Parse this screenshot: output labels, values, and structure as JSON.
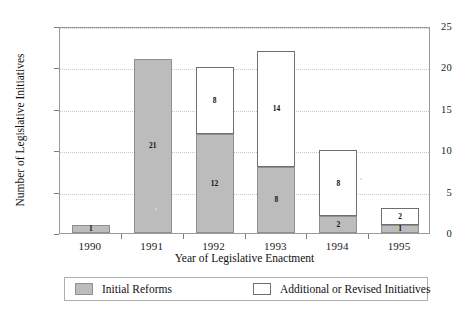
{
  "chart_data": {
    "type": "bar",
    "subtype": "stacked",
    "title": "",
    "xlabel": "Year of Legislative Enactment",
    "ylabel": "Number of Legislative Initiatives",
    "categories": [
      "1990",
      "1991",
      "1992",
      "1993",
      "1994",
      "1995"
    ],
    "ylim": [
      0,
      25
    ],
    "yticks": [
      0,
      5,
      10,
      15,
      20,
      25
    ],
    "ytick_labels": [
      "0",
      "5",
      "10",
      "15",
      "20",
      "25"
    ],
    "grid": true,
    "grid_axis": "y",
    "legend_position": "bottom",
    "series": [
      {
        "name": "Initial Reforms",
        "color": "#bcbcbc",
        "values": [
          1,
          21,
          12,
          8,
          2,
          1
        ]
      },
      {
        "name": "Additional or Revised Initiatives",
        "color": "#ffffff",
        "values": [
          0,
          0,
          8,
          14,
          8,
          2
        ]
      }
    ],
    "totals": [
      1,
      21,
      20,
      22,
      10,
      3
    ],
    "data_labels": {
      "1990": {
        "initial": "1",
        "additional": ""
      },
      "1991": {
        "initial": "21",
        "additional": ""
      },
      "1992": {
        "initial": "12",
        "additional": "8"
      },
      "1993": {
        "initial": "8",
        "additional": "14"
      },
      "1994": {
        "initial": "2",
        "additional": "8"
      },
      "1995": {
        "initial": "1",
        "additional": "2"
      }
    }
  },
  "axes": {
    "y_title": "Number of Legislative Initiatives",
    "x_title": "Year of Legislative Enactment",
    "y_ticks": [
      {
        "label": "25",
        "value": 25
      },
      {
        "label": "20",
        "value": 20
      },
      {
        "label": "15",
        "value": 15
      },
      {
        "label": "10",
        "value": 10
      },
      {
        "label": "5",
        "value": 5
      },
      {
        "label": "0",
        "value": 0
      }
    ],
    "x_ticks": [
      {
        "label": "1990"
      },
      {
        "label": "1991"
      },
      {
        "label": "1992"
      },
      {
        "label": "1993"
      },
      {
        "label": "1994"
      },
      {
        "label": "1995"
      }
    ]
  },
  "bars": [
    {
      "year": "1990",
      "initial_value": 1,
      "initial_label": "1",
      "additional_value": 0,
      "additional_label": ""
    },
    {
      "year": "1991",
      "initial_value": 21,
      "initial_label": "21",
      "additional_value": 0,
      "additional_label": ""
    },
    {
      "year": "1992",
      "initial_value": 12,
      "initial_label": "12",
      "additional_value": 8,
      "additional_label": "8"
    },
    {
      "year": "1993",
      "initial_value": 8,
      "initial_label": "8",
      "additional_value": 14,
      "additional_label": "14"
    },
    {
      "year": "1994",
      "initial_value": 2,
      "initial_label": "2",
      "additional_value": 8,
      "additional_label": "8"
    },
    {
      "year": "1995",
      "initial_value": 1,
      "initial_label": "1",
      "additional_value": 2,
      "additional_label": "2"
    }
  ],
  "legend": {
    "items": [
      {
        "label": "Initial Reforms",
        "color": "#bcbcbc",
        "swatch": "initial"
      },
      {
        "label": "Additional or Revised Initiatives",
        "color": "#ffffff",
        "swatch": "additional"
      }
    ]
  },
  "colors": {
    "initial_reforms_fill": "#bcbcbc",
    "additional_fill": "#ffffff",
    "bar_outline": "#8f8f8f",
    "grid": "#c9c9c9",
    "frame": "#9a9a9a",
    "text": "#1a1a1a"
  }
}
